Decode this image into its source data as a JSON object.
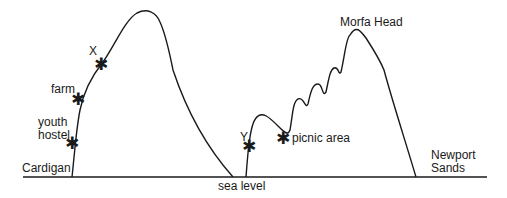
{
  "diagram": {
    "title": "",
    "line_color": "#1a1a1a",
    "background": "#ffffff",
    "places": {
      "left_town": "Cardigan",
      "sea_level": "sea level",
      "right_peak": "Morfa Head",
      "right_town": "Newport\nSands"
    },
    "markers": [
      {
        "id": "X",
        "label": "X",
        "symbol": "✱"
      },
      {
        "id": "farm",
        "label": "farm",
        "symbol": "✱"
      },
      {
        "id": "youth-hostel",
        "label": "youth\nhostel",
        "symbol": "✱"
      },
      {
        "id": "Y",
        "label": "Y",
        "symbol": "✱"
      },
      {
        "id": "picnic-area",
        "label": "picnic area",
        "symbol": "✱"
      }
    ]
  }
}
